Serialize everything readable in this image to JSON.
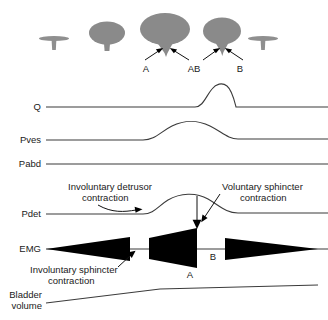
{
  "figure": {
    "bladder_icons": [
      {
        "name": "empty-bladder-left",
        "state": "empty"
      },
      {
        "name": "filling-bladder",
        "state": "partially-filled"
      },
      {
        "name": "full-bladder-leaking",
        "state": "full-funnelled"
      },
      {
        "name": "emptying-bladder",
        "state": "reduced-funnelled"
      },
      {
        "name": "empty-bladder-right",
        "state": "empty"
      }
    ],
    "point_markers": [
      {
        "label": "A"
      },
      {
        "label": "AB"
      },
      {
        "label": "B"
      }
    ],
    "channels": [
      {
        "id": "q",
        "label": "Q"
      },
      {
        "id": "pves",
        "label": "Pves"
      },
      {
        "id": "pabd",
        "label": "Pabd"
      },
      {
        "id": "pdet",
        "label": "Pdet"
      },
      {
        "id": "emg",
        "label": "EMG"
      },
      {
        "id": "volume",
        "label_line1": "Bladder",
        "label_line2": "volume"
      }
    ],
    "annotations": [
      {
        "id": "detrusor",
        "line1": "Involuntary detrusor",
        "line2": "contraction"
      },
      {
        "id": "vol-sph",
        "line1": "Voluntary sphincter",
        "line2": "contraction"
      },
      {
        "id": "invol-sph",
        "line1": "Involuntary sphincter",
        "line2": "contraction"
      }
    ],
    "emg_markers": [
      {
        "label": "A"
      },
      {
        "label": "B"
      }
    ],
    "colors": {
      "trace": "#3b3b3b",
      "emg_fill": "#000000",
      "bladder_fill": "#8a8a8a",
      "text": "#1a1a1a",
      "background": "#ffffff"
    }
  }
}
